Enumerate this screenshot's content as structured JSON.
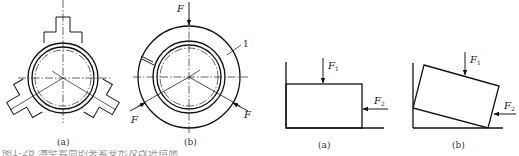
{
  "figure_left": {
    "panel_a": {
      "caption": "(a)"
    },
    "panel_b": {
      "caption": "(b)",
      "force_label": "F",
      "part_number": "1"
    }
  },
  "figure_right": {
    "panel_a": {
      "caption": "(a)",
      "force_1": {
        "symbol": "F",
        "subscript": "1"
      },
      "force_2": {
        "symbol": "F",
        "subscript": "2"
      }
    },
    "panel_b": {
      "caption": "(b)",
      "force_1": {
        "symbol": "F",
        "subscript": "1"
      },
      "force_2": {
        "symbol": "F",
        "subscript": "2"
      }
    }
  },
  "cut_off_caption": "图1-28 薄壁套筒的夹紧变形及改进措施"
}
